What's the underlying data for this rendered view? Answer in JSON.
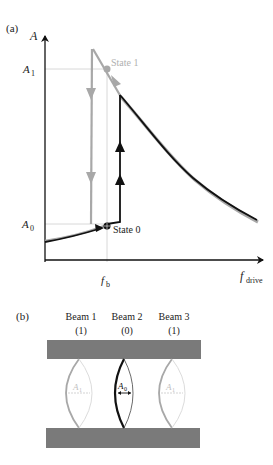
{
  "panel_a": {
    "label": "(a)",
    "y_axis_label": "A",
    "x_axis_label_main": "f",
    "x_axis_label_sub": "drive",
    "tick_f_b_main": "f",
    "tick_f_b_sub": "b",
    "tick_A1_main": "A",
    "tick_A1_sub": "1",
    "tick_A0_main": "A",
    "tick_A0_sub": "0",
    "state1_label": "State 1",
    "state0_label": "State 0"
  },
  "panel_b": {
    "label": "(b)",
    "beams": [
      {
        "name": "Beam 1",
        "state": "(1)",
        "amp_main": "A",
        "amp_sub": "1"
      },
      {
        "name": "Beam 2",
        "state": "(0)",
        "amp_main": "A",
        "amp_sub": "0"
      },
      {
        "name": "Beam 3",
        "state": "(1)",
        "amp_main": "A",
        "amp_sub": "1"
      }
    ]
  },
  "colors": {
    "black": "#111111",
    "gray_branch": "#a8a8a8",
    "guide": "#d8d8d8",
    "state1_text": "#b0b0b0",
    "bar_fill": "#7a7a7a"
  }
}
